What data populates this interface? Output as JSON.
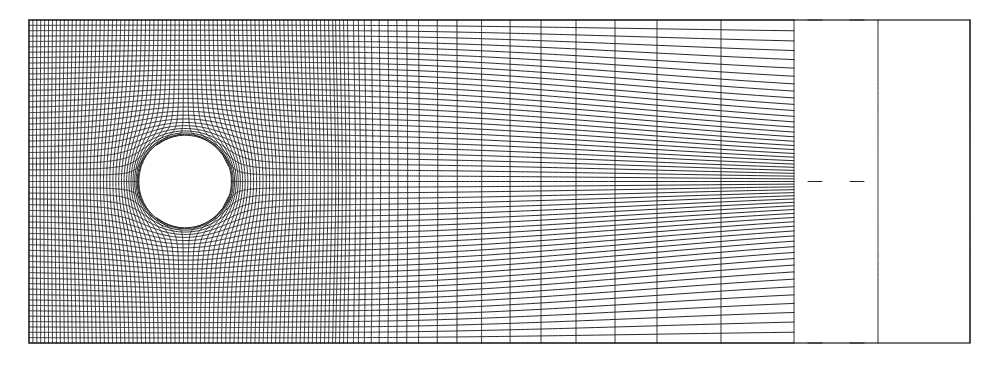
{
  "figure": {
    "background": "#ffffff",
    "line_color": "#1c1c1c"
  },
  "mesh": {
    "domain": {
      "x_min": 29,
      "x_max": 970,
      "y_min": 20,
      "y_max": 343,
      "y_center": 181.5
    },
    "cylinder": {
      "cx": 185,
      "cy": 181.5,
      "r": 46
    },
    "uniform_x": {
      "start": 29,
      "end": 330,
      "intervals": 74
    },
    "stretched_x": [
      333,
      337,
      341,
      345,
      351,
      356,
      362,
      369,
      377,
      386,
      395,
      405,
      417,
      436,
      456,
      481,
      510,
      541,
      576,
      615,
      657,
      721,
      794,
      878,
      970
    ],
    "lines_per_half_y": 29,
    "y_clustering": {
      "blend_start_x": 335,
      "blend_end_x": 970,
      "beta": 1.9
    }
  }
}
